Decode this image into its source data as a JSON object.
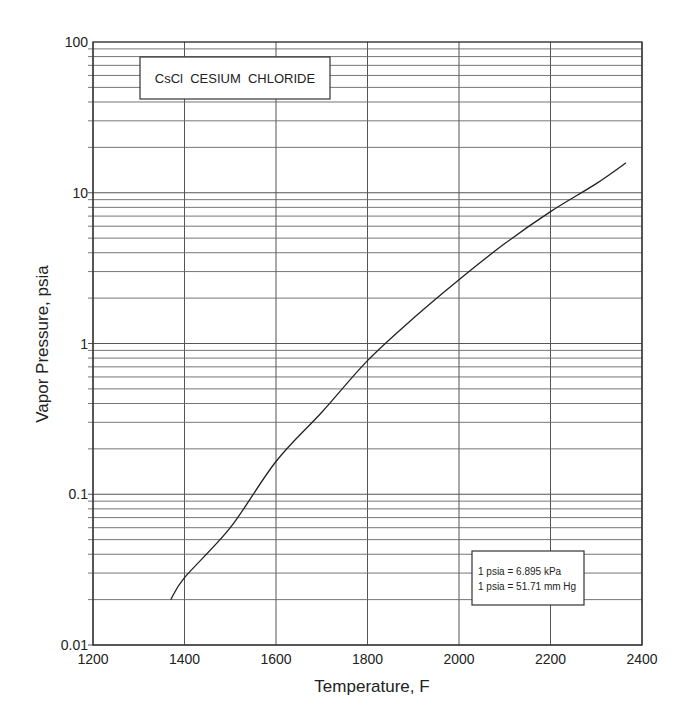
{
  "chart_data": {
    "type": "line",
    "title": "CsCl  CESIUM  CHLORIDE",
    "xlabel": "Temperature, F",
    "ylabel": "Vapor Pressure, psia",
    "xscale": "linear",
    "yscale": "log",
    "xlim": [
      1200,
      2400
    ],
    "ylim": [
      0.01,
      100
    ],
    "x_ticks": [
      1200,
      1400,
      1600,
      1800,
      2000,
      2200,
      2400
    ],
    "x_tick_labels": [
      "1200",
      "1400",
      "1600",
      "1800",
      "2000",
      "2200",
      "2400"
    ],
    "y_ticks": [
      0.01,
      0.1,
      1,
      10,
      100
    ],
    "y_tick_labels": [
      "0.01",
      "0.1",
      "1",
      "10",
      "100"
    ],
    "grid": true,
    "legend": null,
    "annotations": [
      "1 psia = 6.895 kPa",
      "1 psia = 51.71 mm Hg"
    ],
    "series": [
      {
        "name": "CsCl vapor pressure",
        "x": [
          1370,
          1400,
          1500,
          1600,
          1700,
          1800,
          1900,
          2000,
          2100,
          2200,
          2300,
          2365
        ],
        "values": [
          0.02,
          0.028,
          0.06,
          0.165,
          0.35,
          0.77,
          1.47,
          2.65,
          4.6,
          7.5,
          11.5,
          15.8
        ]
      }
    ]
  },
  "title_box": {
    "text": "CsCl  CESIUM  CHLORIDE"
  },
  "note_box": {
    "line1": "1 psia = 6.895 kPa",
    "line2": "1 psia = 51.71 mm Hg"
  },
  "axes": {
    "xlabel": "Temperature, F",
    "ylabel": "Vapor Pressure, psia"
  }
}
